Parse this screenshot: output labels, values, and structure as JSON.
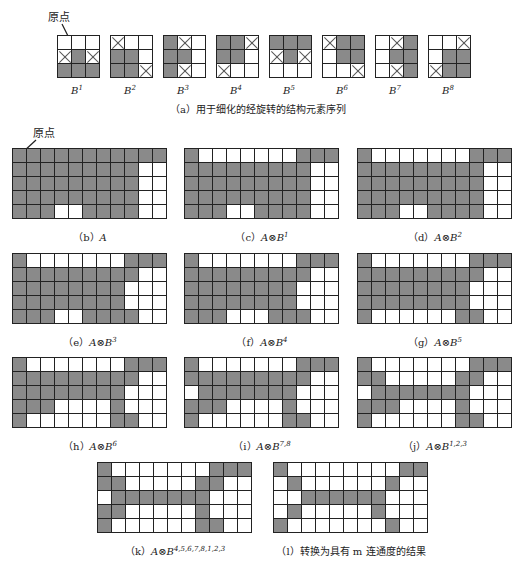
{
  "origin_label": "原点",
  "top_caption": "（a）用于细化的经旋转的结构元素序列",
  "structuring_elements": [
    {
      "name": "B",
      "sup": "1",
      "cells": [
        [
          "w",
          "w",
          "w"
        ],
        [
          "x",
          "g",
          "x"
        ],
        [
          "g",
          "g",
          "g"
        ]
      ]
    },
    {
      "name": "B",
      "sup": "2",
      "cells": [
        [
          "x",
          "w",
          "w"
        ],
        [
          "g",
          "g",
          "w"
        ],
        [
          "g",
          "g",
          "x"
        ]
      ]
    },
    {
      "name": "B",
      "sup": "3",
      "cells": [
        [
          "g",
          "x",
          "w"
        ],
        [
          "g",
          "g",
          "w"
        ],
        [
          "g",
          "x",
          "w"
        ]
      ]
    },
    {
      "name": "B",
      "sup": "4",
      "cells": [
        [
          "g",
          "g",
          "x"
        ],
        [
          "g",
          "g",
          "w"
        ],
        [
          "x",
          "w",
          "w"
        ]
      ]
    },
    {
      "name": "B",
      "sup": "5",
      "cells": [
        [
          "g",
          "g",
          "g"
        ],
        [
          "x",
          "g",
          "x"
        ],
        [
          "w",
          "w",
          "w"
        ]
      ]
    },
    {
      "name": "B",
      "sup": "6",
      "cells": [
        [
          "x",
          "g",
          "g"
        ],
        [
          "w",
          "g",
          "g"
        ],
        [
          "w",
          "w",
          "x"
        ]
      ]
    },
    {
      "name": "B",
      "sup": "7",
      "cells": [
        [
          "w",
          "x",
          "g"
        ],
        [
          "w",
          "g",
          "g"
        ],
        [
          "w",
          "x",
          "g"
        ]
      ]
    },
    {
      "name": "B",
      "sup": "8",
      "cells": [
        [
          "w",
          "w",
          "x"
        ],
        [
          "w",
          "g",
          "g"
        ],
        [
          "x",
          "g",
          "g"
        ]
      ]
    }
  ],
  "panels": [
    {
      "id": "b",
      "prefix": "（b）",
      "expr": "A",
      "sup": "",
      "rows": [
        [
          1,
          1,
          1,
          1,
          1,
          1,
          1,
          1,
          1,
          1,
          1
        ],
        [
          1,
          1,
          1,
          1,
          1,
          1,
          1,
          1,
          1,
          0,
          0
        ],
        [
          1,
          1,
          1,
          1,
          1,
          1,
          1,
          1,
          1,
          0,
          0
        ],
        [
          1,
          1,
          1,
          1,
          1,
          1,
          1,
          1,
          1,
          0,
          0
        ],
        [
          1,
          1,
          1,
          0,
          0,
          1,
          1,
          1,
          1,
          0,
          0
        ]
      ]
    },
    {
      "id": "c",
      "prefix": "（c）",
      "expr": "A⊗B",
      "sup": "1",
      "rows": [
        [
          1,
          0,
          0,
          0,
          0,
          0,
          0,
          0,
          1,
          1,
          1
        ],
        [
          1,
          1,
          1,
          1,
          1,
          1,
          1,
          1,
          1,
          0,
          0
        ],
        [
          1,
          1,
          1,
          1,
          1,
          1,
          1,
          1,
          1,
          0,
          0
        ],
        [
          1,
          1,
          1,
          1,
          1,
          1,
          1,
          1,
          1,
          0,
          0
        ],
        [
          1,
          1,
          1,
          0,
          0,
          1,
          1,
          1,
          1,
          0,
          0
        ]
      ]
    },
    {
      "id": "d",
      "prefix": "（d）",
      "expr": "A⊗B",
      "sup": "2",
      "rows": [
        [
          1,
          0,
          0,
          0,
          0,
          0,
          0,
          0,
          1,
          1,
          1
        ],
        [
          1,
          1,
          1,
          1,
          1,
          1,
          1,
          1,
          1,
          0,
          0
        ],
        [
          1,
          1,
          1,
          1,
          1,
          1,
          1,
          1,
          1,
          0,
          0
        ],
        [
          1,
          1,
          1,
          1,
          1,
          1,
          1,
          1,
          1,
          0,
          0
        ],
        [
          1,
          1,
          1,
          0,
          0,
          1,
          1,
          1,
          1,
          0,
          0
        ]
      ]
    },
    {
      "id": "e",
      "prefix": "（e）",
      "expr": "A⊗B",
      "sup": "3",
      "rows": [
        [
          1,
          0,
          0,
          0,
          0,
          0,
          0,
          0,
          1,
          1,
          1
        ],
        [
          1,
          1,
          1,
          1,
          1,
          1,
          1,
          1,
          1,
          0,
          0
        ],
        [
          1,
          1,
          1,
          1,
          1,
          1,
          1,
          1,
          0,
          0,
          0
        ],
        [
          1,
          1,
          1,
          1,
          1,
          1,
          1,
          1,
          0,
          0,
          0
        ],
        [
          1,
          1,
          1,
          0,
          0,
          1,
          1,
          1,
          1,
          0,
          0
        ]
      ]
    },
    {
      "id": "f",
      "prefix": "（f）",
      "expr": "A⊗B",
      "sup": "4",
      "rows": [
        [
          1,
          0,
          0,
          0,
          0,
          0,
          0,
          0,
          1,
          1,
          1
        ],
        [
          1,
          1,
          1,
          1,
          1,
          1,
          1,
          1,
          1,
          0,
          0
        ],
        [
          1,
          1,
          1,
          1,
          1,
          1,
          1,
          1,
          0,
          0,
          0
        ],
        [
          1,
          1,
          1,
          1,
          1,
          1,
          1,
          1,
          0,
          0,
          0
        ],
        [
          1,
          1,
          1,
          0,
          0,
          0,
          1,
          1,
          1,
          0,
          0
        ]
      ]
    },
    {
      "id": "g",
      "prefix": "（g）",
      "expr": "A⊗B",
      "sup": "5",
      "rows": [
        [
          1,
          0,
          0,
          0,
          0,
          0,
          0,
          0,
          1,
          1,
          1
        ],
        [
          1,
          1,
          1,
          1,
          1,
          1,
          1,
          1,
          1,
          0,
          0
        ],
        [
          1,
          1,
          1,
          1,
          1,
          1,
          1,
          1,
          0,
          0,
          0
        ],
        [
          1,
          1,
          1,
          1,
          1,
          1,
          1,
          1,
          0,
          0,
          0
        ],
        [
          1,
          0,
          0,
          0,
          0,
          0,
          0,
          1,
          1,
          0,
          0
        ]
      ]
    },
    {
      "id": "h",
      "prefix": "（h）",
      "expr": "A⊗B",
      "sup": "6",
      "rows": [
        [
          1,
          0,
          0,
          0,
          0,
          0,
          0,
          0,
          1,
          1,
          1
        ],
        [
          1,
          1,
          1,
          1,
          1,
          1,
          1,
          1,
          1,
          0,
          0
        ],
        [
          1,
          1,
          1,
          1,
          1,
          1,
          1,
          1,
          0,
          0,
          0
        ],
        [
          1,
          1,
          1,
          0,
          0,
          0,
          0,
          1,
          0,
          0,
          0
        ],
        [
          1,
          0,
          0,
          0,
          0,
          0,
          0,
          1,
          1,
          0,
          0
        ]
      ]
    },
    {
      "id": "i",
      "prefix": "（i）",
      "expr": "A⊗B",
      "sup": "7,8",
      "rows": [
        [
          1,
          0,
          0,
          0,
          0,
          0,
          0,
          0,
          1,
          1,
          1
        ],
        [
          1,
          1,
          1,
          1,
          1,
          1,
          1,
          1,
          1,
          0,
          0
        ],
        [
          0,
          1,
          1,
          1,
          1,
          1,
          1,
          1,
          0,
          0,
          0
        ],
        [
          1,
          1,
          1,
          0,
          0,
          0,
          0,
          1,
          0,
          0,
          0
        ],
        [
          1,
          0,
          0,
          0,
          0,
          0,
          0,
          1,
          1,
          0,
          0
        ]
      ]
    },
    {
      "id": "j",
      "prefix": "（j）",
      "expr": "A⊗B",
      "sup": "1,2,3",
      "rows": [
        [
          1,
          0,
          0,
          0,
          0,
          0,
          0,
          0,
          1,
          1,
          1
        ],
        [
          1,
          1,
          0,
          0,
          0,
          0,
          0,
          1,
          1,
          0,
          0
        ],
        [
          0,
          1,
          1,
          1,
          1,
          1,
          1,
          1,
          0,
          0,
          0
        ],
        [
          1,
          1,
          1,
          0,
          0,
          0,
          0,
          1,
          0,
          0,
          0
        ],
        [
          1,
          0,
          0,
          0,
          0,
          0,
          0,
          1,
          1,
          0,
          0
        ]
      ]
    },
    {
      "id": "k",
      "prefix": "（k）",
      "expr": "A⊗B",
      "sup": "4,5,6,7,8,1,2,3",
      "rows": [
        [
          1,
          0,
          0,
          0,
          0,
          0,
          0,
          0,
          1,
          1,
          1
        ],
        [
          1,
          1,
          0,
          0,
          0,
          0,
          0,
          1,
          1,
          0,
          0
        ],
        [
          0,
          1,
          1,
          1,
          1,
          1,
          1,
          1,
          0,
          0,
          0
        ],
        [
          1,
          1,
          0,
          0,
          0,
          0,
          0,
          1,
          0,
          0,
          0
        ],
        [
          1,
          0,
          0,
          0,
          0,
          0,
          0,
          1,
          1,
          0,
          0
        ]
      ]
    },
    {
      "id": "l",
      "prefix": "（l）",
      "expr": "转换为具有 m 连通度的结果",
      "sup": "",
      "rows": [
        [
          1,
          0,
          0,
          0,
          0,
          0,
          0,
          0,
          0,
          1,
          1
        ],
        [
          0,
          1,
          0,
          0,
          0,
          0,
          0,
          0,
          1,
          0,
          0
        ],
        [
          0,
          0,
          1,
          1,
          1,
          1,
          1,
          1,
          0,
          0,
          0
        ],
        [
          0,
          1,
          0,
          0,
          0,
          0,
          0,
          1,
          0,
          0,
          0
        ],
        [
          1,
          0,
          0,
          0,
          0,
          0,
          0,
          0,
          1,
          0,
          0
        ]
      ]
    }
  ],
  "colors": {
    "foreground": "#8a8a8a",
    "background": "#ffffff",
    "grid_line": "#222222"
  }
}
